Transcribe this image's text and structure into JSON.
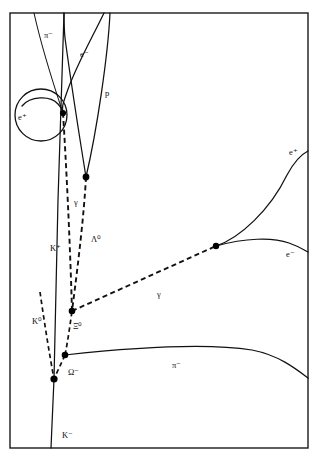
{
  "figure": {
    "kind": "bubble-chamber-event-diagram",
    "background_color": "#ffffff",
    "ink_color": "#111111",
    "frame": {
      "x": 10,
      "y": 13,
      "width": 298,
      "height": 435
    }
  },
  "labels": {
    "pi_minus_top": "π⁻",
    "e_minus_top": "e⁻",
    "proton": "p",
    "e_plus_spiral": "e⁺",
    "gamma_upper": "γ",
    "lambda_zero": "Λ⁰",
    "k_plus": "K⁺",
    "k_zero": "K⁰",
    "xi_zero": "Ξ⁰",
    "gamma_lower": "γ",
    "omega_minus": "Ω⁻",
    "pi_minus_bottom": "π⁻",
    "k_minus": "K⁻",
    "e_plus_right": "e⁺",
    "e_minus_right": "e⁻"
  },
  "label_positions": {
    "pi_minus_top": {
      "x": 44,
      "y": 38
    },
    "e_minus_top": {
      "x": 80,
      "y": 57
    },
    "proton": {
      "x": 105,
      "y": 96
    },
    "e_plus_spiral": {
      "x": 18,
      "y": 120
    },
    "gamma_upper": {
      "x": 74,
      "y": 205
    },
    "lambda_zero": {
      "x": 91,
      "y": 242
    },
    "k_plus": {
      "x": 50,
      "y": 251
    },
    "k_zero": {
      "x": 32,
      "y": 324
    },
    "xi_zero": {
      "x": 73,
      "y": 329
    },
    "gamma_lower": {
      "x": 157,
      "y": 297
    },
    "omega_minus": {
      "x": 68,
      "y": 375
    },
    "pi_minus_bottom": {
      "x": 172,
      "y": 368
    },
    "k_minus": {
      "x": 62,
      "y": 438
    },
    "e_plus_right": {
      "x": 289,
      "y": 155
    },
    "e_minus_right": {
      "x": 286,
      "y": 257
    }
  },
  "tracks": [
    {
      "name": "pi-minus-incoming-top",
      "style": "solid",
      "particle": "π⁻"
    },
    {
      "name": "e-minus-upper-curve",
      "style": "solid",
      "particle": "e⁻"
    },
    {
      "name": "proton-track",
      "style": "solid",
      "particle": "p"
    },
    {
      "name": "e-plus-spiral",
      "style": "solid",
      "particle": "e⁺"
    },
    {
      "name": "k-plus-track",
      "style": "solid",
      "particle": "K⁺"
    },
    {
      "name": "k-minus-beam",
      "style": "solid",
      "particle": "K⁻"
    },
    {
      "name": "pi-minus-lower-curve",
      "style": "solid",
      "particle": "π⁻"
    },
    {
      "name": "e-plus-right-curve",
      "style": "solid",
      "particle": "e⁺"
    },
    {
      "name": "e-minus-right-curve",
      "style": "solid",
      "particle": "e⁻"
    },
    {
      "name": "gamma-upper-dashed",
      "style": "dashed",
      "particle": "γ"
    },
    {
      "name": "lambda-zero-dashed",
      "style": "dashed",
      "particle": "Λ⁰"
    },
    {
      "name": "gamma-lower-dashed",
      "style": "dashed",
      "particle": "γ"
    },
    {
      "name": "k-zero-dashed",
      "style": "dashed",
      "particle": "K⁰"
    },
    {
      "name": "xi-zero-dashed",
      "style": "dashed",
      "particle": "Ξ⁰"
    }
  ],
  "vertices": [
    {
      "name": "gamma-conversion-upper",
      "x": 63,
      "y": 113,
      "r": 3.1
    },
    {
      "name": "lambda-decay-vertex",
      "x": 86,
      "y": 177,
      "r": 3.4
    },
    {
      "name": "gamma-conversion-right",
      "x": 216,
      "y": 246,
      "r": 3.2
    },
    {
      "name": "xi-zero-decay-vertex",
      "x": 72,
      "y": 311,
      "r": 3.3
    },
    {
      "name": "omega-decay-vertex",
      "x": 65,
      "y": 355,
      "r": 3.3
    },
    {
      "name": "omega-production-vertex",
      "x": 54,
      "y": 379,
      "r": 3.6
    }
  ]
}
